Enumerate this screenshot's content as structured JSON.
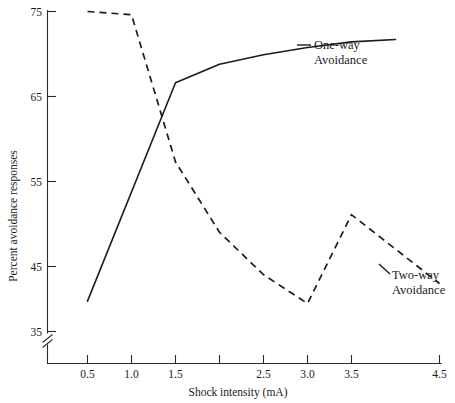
{
  "chart_data": {
    "type": "line",
    "title": "",
    "subtitle": "",
    "xlabel": "Shock intensity (mA)",
    "ylabel": "Percent avoidance responses",
    "xlim": [
      0.25,
      4.75
    ],
    "ylim": [
      33,
      76
    ],
    "grid": false,
    "legend_position": "inline-right-of-series",
    "y_axis_break": true,
    "y_axis_break_note": "axis break below 35",
    "x_ticks": [
      0.5,
      1.0,
      1.5,
      2.0,
      2.5,
      3.0,
      3.5,
      4.5
    ],
    "x_tick_labels": [
      "0.5",
      "1.0",
      "1.5",
      "",
      "2.5",
      "3.0",
      "3.5",
      "4.5"
    ],
    "y_ticks": [
      35,
      45,
      55,
      65,
      75
    ],
    "y_tick_labels": [
      "35",
      "45",
      "55",
      "65",
      "75"
    ],
    "series": [
      {
        "name": "One-way Avoidance",
        "style": "solid",
        "label_line1": "One-way",
        "label_line2": "Avoidance",
        "x": [
          0.5,
          1.5,
          2.0,
          2.5,
          3.0,
          3.5,
          4.0
        ],
        "values": [
          38.8,
          66.1,
          68.4,
          69.6,
          70.5,
          71.2,
          71.5
        ]
      },
      {
        "name": "Two-way Avoidance",
        "style": "dashed",
        "label_line1": "Two-way",
        "label_line2": "Avoidance",
        "x": [
          0.5,
          1.0,
          1.5,
          2.0,
          2.5,
          3.0,
          3.5,
          4.5
        ],
        "values": [
          75.0,
          74.6,
          56.2,
          47.4,
          42.1,
          38.5,
          49.6,
          41.0
        ]
      }
    ]
  },
  "figure": {
    "axis_color": "#2b2b2b",
    "line_color": "#1b1b1b",
    "background": "#ffffff"
  }
}
